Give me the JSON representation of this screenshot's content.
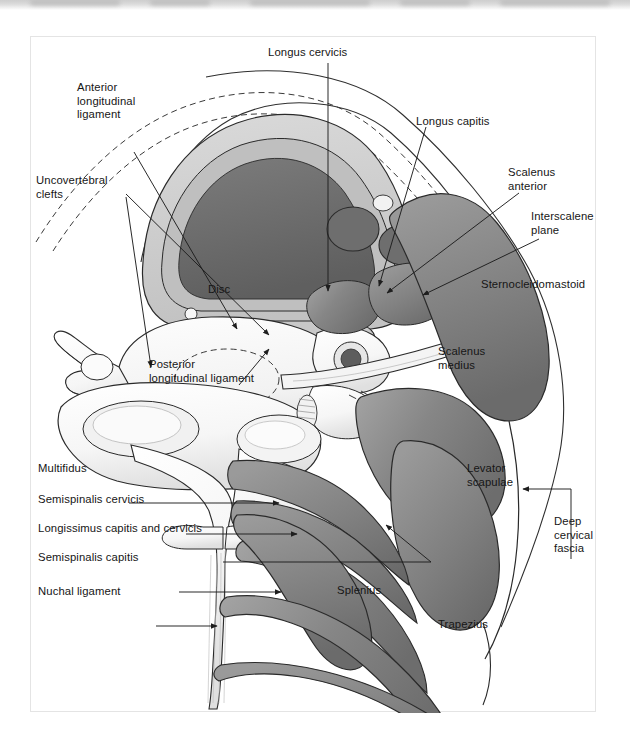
{
  "figure": {
    "kind": "anatomical-cross-section",
    "region": "cervical spine axial cross-section",
    "background_color": "#ffffff",
    "ink_color": "#161616",
    "palette": {
      "muscle_fill": "#808080",
      "muscle_fill_dark": "#6e6e6e",
      "muscle_highlight": "#a9a9a9",
      "bone_fill": "#fbfbfb",
      "bone_shade": "#dcdcdc",
      "cord_core": "#6f6f6f",
      "cord_ring": "#c9c9c9",
      "disc_fill": "#f4f4f4",
      "vessel_fill": "#7d7d7d",
      "outline": "#2a2a2a"
    },
    "labels": [
      {
        "id": "longus-cervicis",
        "text": "Longus cervicis",
        "lines": [
          "Longus cervicis"
        ],
        "x": 267,
        "y": 45,
        "align": "left"
      },
      {
        "id": "anterior-longitudinal-ligament",
        "text": "Anterior longitudinal ligament",
        "lines": [
          "Anterior",
          "longitudinal",
          "ligament"
        ],
        "x": 76,
        "y": 80,
        "align": "left"
      },
      {
        "id": "longus-capitis",
        "text": "Longus capitis",
        "lines": [
          "Longus capitis"
        ],
        "x": 415,
        "y": 114,
        "align": "left"
      },
      {
        "id": "uncovertebral-clefts",
        "text": "Uncovertebral clefts",
        "lines": [
          "Uncovertebral",
          "clefts"
        ],
        "x": 35,
        "y": 173,
        "align": "left"
      },
      {
        "id": "scalenus-anterior",
        "text": "Scalenus anterior",
        "lines": [
          "Scalenus",
          "anterior"
        ],
        "x": 507,
        "y": 165,
        "align": "left"
      },
      {
        "id": "interscalene-plane",
        "text": "Interscalene plane",
        "lines": [
          "Interscalene",
          "plane"
        ],
        "x": 530,
        "y": 209,
        "align": "left"
      },
      {
        "id": "sternocleidomastoid",
        "text": "Sternocleidomastoid",
        "lines": [
          "Sternocleidomastoid"
        ],
        "x": 480,
        "y": 277,
        "align": "left"
      },
      {
        "id": "disc",
        "text": "Disc",
        "lines": [
          "Disc"
        ],
        "x": 207,
        "y": 282,
        "align": "left"
      },
      {
        "id": "scalenus-medius",
        "text": "Scalenus medius",
        "lines": [
          "Scalenus",
          "medius"
        ],
        "x": 437,
        "y": 344,
        "align": "left"
      },
      {
        "id": "posterior-longitudinal-ligament",
        "text": "Posterior longitudinal ligament",
        "lines": [
          "Posterior",
          "longitudinal ligament"
        ],
        "x": 148,
        "y": 357,
        "align": "left"
      },
      {
        "id": "levator-scapulae",
        "text": "Levator scapulae",
        "lines": [
          "Levator",
          "scapulae"
        ],
        "x": 466,
        "y": 461,
        "align": "left"
      },
      {
        "id": "multifidus",
        "text": "Multifidus",
        "lines": [
          "Multifidus"
        ],
        "x": 37,
        "y": 461,
        "align": "left"
      },
      {
        "id": "semispinalis-cervicis",
        "text": "Semispinalis cervicis",
        "lines": [
          "Semispinalis cervicis"
        ],
        "x": 37,
        "y": 492,
        "align": "left"
      },
      {
        "id": "longissimus-capitis-and-cervicis",
        "text": "Longissimus capitis and cervicis",
        "lines": [
          "Longissimus capitis and cervicis"
        ],
        "x": 37,
        "y": 521,
        "align": "left"
      },
      {
        "id": "deep-cervical-fascia",
        "text": "Deep cervical fascia",
        "lines": [
          "Deep",
          "cervical",
          "fascia"
        ],
        "x": 553,
        "y": 514,
        "align": "left"
      },
      {
        "id": "semispinalis-capitis",
        "text": "Semispinalis capitis",
        "lines": [
          "Semispinalis capitis"
        ],
        "x": 37,
        "y": 550,
        "align": "left"
      },
      {
        "id": "splenius",
        "text": "Splenius",
        "lines": [
          "Splenius"
        ],
        "x": 336,
        "y": 583,
        "align": "left"
      },
      {
        "id": "nuchal-ligament",
        "text": "Nuchal ligament",
        "lines": [
          "Nuchal ligament"
        ],
        "x": 37,
        "y": 584,
        "align": "left"
      },
      {
        "id": "trapezius",
        "text": "Trapezius",
        "lines": [
          "Trapezius"
        ],
        "x": 437,
        "y": 617,
        "align": "left"
      }
    ]
  }
}
